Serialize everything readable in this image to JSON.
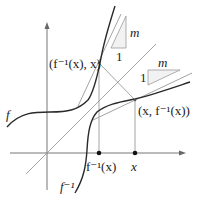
{
  "diagram": {
    "labels": {
      "point_upper": "(f⁻¹(x), x)",
      "point_lower": "(x, f⁻¹(x))",
      "tick_finv": "f⁻¹(x)",
      "tick_x": "x",
      "curve_f": "f",
      "curve_finv": "f⁻¹",
      "slope_m_upper": "m",
      "slope_1_upper": "1",
      "slope_m_lower": "m",
      "slope_1_lower": "1"
    },
    "colors": {
      "curve": "#2a2a2a",
      "guide": "#9a9a9a",
      "triangle_fill": "#f2f2f2",
      "axis": "#666666"
    }
  }
}
